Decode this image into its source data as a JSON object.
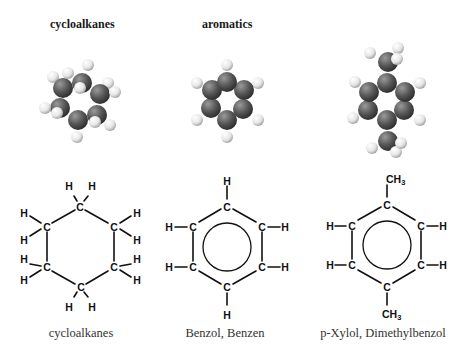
{
  "headers": {
    "left": "cycloalkanes",
    "middle": "aromatics"
  },
  "captions": {
    "left": "cycloalkanes",
    "middle": "Benzol, Benzen",
    "right": "p-Xylol, Dimethylbenzol"
  },
  "atoms": {
    "carbon": "C",
    "hydrogen": "H",
    "methyl_main": "CH",
    "methyl_sub": "3"
  },
  "colors": {
    "carbon_sphere": "#555555",
    "hydrogen_sphere": "#f0f0f0",
    "bond_line": "#111111"
  }
}
